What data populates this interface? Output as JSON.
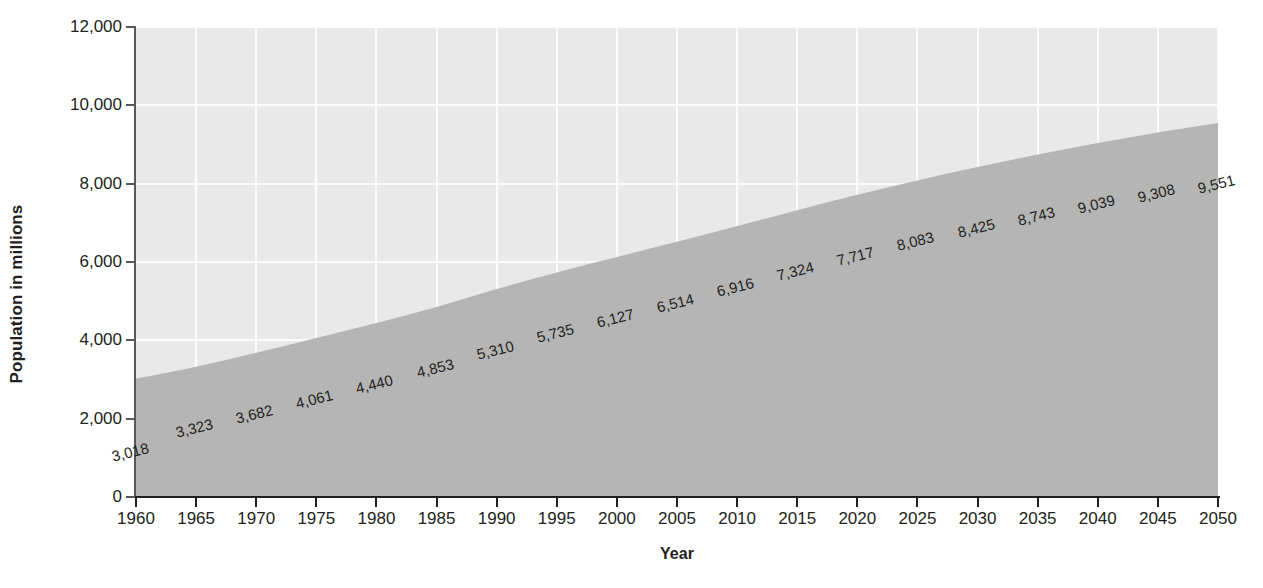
{
  "chart_data": {
    "type": "area",
    "title": "",
    "xlabel": "Year",
    "ylabel": "Population in millions",
    "xlim": [
      1960,
      2050
    ],
    "ylim": [
      0,
      12000
    ],
    "grid": true,
    "legend": "none",
    "x_ticks": [
      "1960",
      "1965",
      "1970",
      "1975",
      "1980",
      "1985",
      "1990",
      "1995",
      "2000",
      "2005",
      "2010",
      "2015",
      "2020",
      "2025",
      "2030",
      "2035",
      "2040",
      "2045",
      "2050"
    ],
    "y_ticks": [
      "0",
      "2,000",
      "4,000",
      "6,000",
      "8,000",
      "10,000",
      "12,000"
    ],
    "y_tick_values": [
      0,
      2000,
      4000,
      6000,
      8000,
      10000,
      12000
    ],
    "categories": [
      1960,
      1965,
      1970,
      1975,
      1980,
      1985,
      1990,
      1995,
      2000,
      2005,
      2010,
      2015,
      2020,
      2025,
      2030,
      2035,
      2040,
      2045,
      2050
    ],
    "values": [
      3018,
      3323,
      3682,
      4061,
      4440,
      4853,
      5310,
      5735,
      6127,
      6514,
      6916,
      7324,
      7717,
      8083,
      8425,
      8743,
      9039,
      9308,
      9551
    ],
    "point_labels": [
      "3,018",
      "3,323",
      "3,682",
      "4,061",
      "4,440",
      "4,853",
      "5,310",
      "5,735",
      "6,127",
      "6,514",
      "6,916",
      "7,324",
      "7,717",
      "8,083",
      "8,425",
      "8,743",
      "9,039",
      "9,308",
      "9,551"
    ],
    "colors": {
      "area_fill": "#b5b5b5",
      "plot_background": "#e9e9e9",
      "gridline": "#fbfbfb",
      "axis": "#231f20",
      "text": "#231f20",
      "page_background": "#ffffff"
    }
  }
}
